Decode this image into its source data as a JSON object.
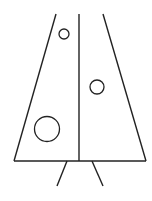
{
  "figure": {
    "stroke_color": "#222222",
    "background": "#ffffff",
    "trapezoid": {
      "top_left": [
        56,
        14
      ],
      "top_right": [
        103,
        14
      ],
      "bottom_left": [
        14,
        161
      ],
      "bottom_right": [
        146,
        161
      ]
    },
    "center_line": {
      "x": 79,
      "y1": 14,
      "y2": 161
    },
    "circles": [
      {
        "cx": 64,
        "cy": 34,
        "r": 5
      },
      {
        "cx": 97,
        "cy": 87,
        "r": 7
      },
      {
        "cx": 47,
        "cy": 129,
        "r": 12.5
      }
    ],
    "legs": [
      {
        "x1": 67,
        "y1": 161,
        "x2": 57,
        "y2": 186
      },
      {
        "x1": 92,
        "y1": 161,
        "x2": 103,
        "y2": 186
      }
    ]
  }
}
